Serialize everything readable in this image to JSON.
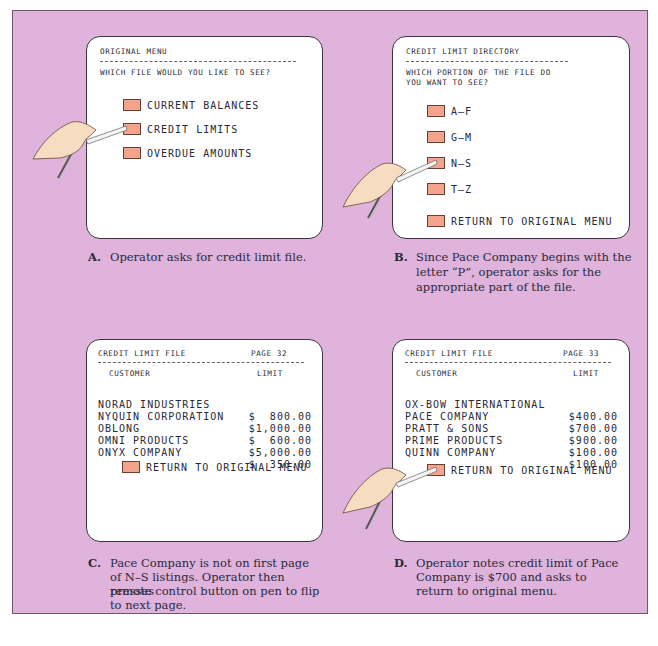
{
  "colors": {
    "board_background": "#dfb3dc",
    "screen_background": "#ffffff",
    "button_fill": "#f4a48c",
    "text": "#2a2a36"
  },
  "panels": {
    "a": {
      "screen": {
        "title": "ORIGINAL MENU",
        "prompt": "WHICH FILE WOULD YOU LIKE TO SEE?",
        "options": [
          {
            "label": "CURRENT BALANCES"
          },
          {
            "label": "CREDIT LIMITS",
            "selected": true
          },
          {
            "label": "OVERDUE AMOUNTS"
          }
        ]
      },
      "caption": {
        "letter": "A.",
        "text": "Operator asks for credit limit file."
      }
    },
    "b": {
      "screen": {
        "title": "CREDIT LIMIT DIRECTORY",
        "prompt_line1": "WHICH PORTION OF THE FILE DO",
        "prompt_line2": "YOU WANT TO SEE?",
        "options": [
          {
            "label": "A–F"
          },
          {
            "label": "G–M"
          },
          {
            "label": "N–S",
            "selected": true
          },
          {
            "label": "T–Z"
          }
        ],
        "return_label": "RETURN TO ORIGINAL MENU"
      },
      "caption": {
        "letter": "B.",
        "line1": "Since Pace Company begins with the",
        "line2": "letter “P”, operator asks for the",
        "line3": "appropriate part of the file."
      }
    },
    "c": {
      "screen": {
        "title": "CREDIT LIMIT FILE",
        "page": "PAGE 32",
        "col_customer": "CUSTOMER",
        "col_limit": "LIMIT",
        "rows": [
          {
            "customer": "NORAD INDUSTRIES",
            "limit": "$  800.00"
          },
          {
            "customer": "NYQUIN CORPORATION",
            "limit": "$1,000.00"
          },
          {
            "customer": "OBLONG",
            "limit": "$  600.00"
          },
          {
            "customer": "OMNI PRODUCTS",
            "limit": "$5,000.00"
          },
          {
            "customer": "ONYX COMPANY",
            "limit": "$  350.00"
          }
        ],
        "return_label": "RETURN TO ORIGINAL MENU"
      },
      "caption": {
        "letter": "C.",
        "line1": "Pace Company is not on first page",
        "line2": "of N–S listings. Operator then presses",
        "line3": "remote control button on pen to flip",
        "line4": "to next page."
      }
    },
    "d": {
      "screen": {
        "title": "CREDIT LIMIT FILE",
        "page": "PAGE 33",
        "col_customer": "CUSTOMER",
        "col_limit": "LIMIT",
        "rows": [
          {
            "customer": "OX-BOW INTERNATIONAL",
            "limit": "$400.00"
          },
          {
            "customer": "PACE COMPANY",
            "limit": "$700.00"
          },
          {
            "customer": "PRATT & SONS",
            "limit": "$900.00"
          },
          {
            "customer": "PRIME PRODUCTS",
            "limit": "$100.00"
          },
          {
            "customer": "QUINN COMPANY",
            "limit": "$100.00"
          }
        ],
        "return_label": "RETURN TO ORIGINAL MENU"
      },
      "caption": {
        "letter": "D.",
        "line1": "Operator notes credit limit of Pace",
        "line2": "Company is $700 and asks to",
        "line3": "return to original menu."
      }
    }
  }
}
